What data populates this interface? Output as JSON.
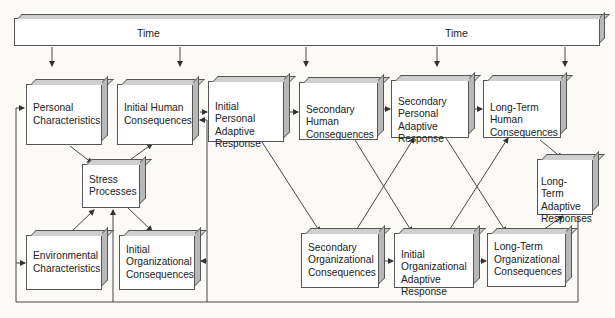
{
  "caption_fragment": "",
  "timeline": {
    "labels": [
      "Time",
      "Time"
    ]
  },
  "boxes": {
    "personal_characteristics": "Personal\nCharacteristics",
    "initial_human_consequences": "Initial Human\nConsequences",
    "initial_personal_adaptive_response": "Initial Personal\nAdaptive\nResponse",
    "secondary_human_consequences": "Secondary\nHuman\nConsequences",
    "secondary_personal_adaptive_response": "Secondary\nPersonal\nAdaptive\nResponse",
    "long_term_human_consequences": "Long-Term\nHuman\nConsequences",
    "stress_processes": "Stress\nProcesses",
    "long_term_adaptive_responses": "Long-\nTerm\nAdaptive\nResponses",
    "environmental_characteristics": "Environmental\nCharacteristics",
    "initial_organizational_consequences": "Initial\nOrganizational\nConsequences",
    "secondary_organizational_consequences": "Secondary\nOrganizational\nConsequences",
    "initial_organizational_adaptive_response": "Initial\nOrganizational\nAdaptive\nResponse",
    "long_term_organizational_consequences": "Long-Term\nOrganizational\nConsequences"
  },
  "colors": {
    "line": "#333333",
    "box_face": "#ffffff",
    "box_side": "#b8b8b8",
    "background": "#fbfaf6"
  }
}
